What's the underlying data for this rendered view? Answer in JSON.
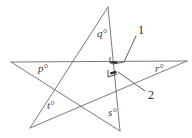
{
  "figure": {
    "kind": "geometry-star-polygon-diagram",
    "width": 192,
    "height": 138,
    "background_color": "#ffffff",
    "stroke_color": "#6b6b6b",
    "stroke_width": 0.9,
    "angle_labels": [
      {
        "id": "q",
        "text": "q°",
        "x": 97,
        "y": 28
      },
      {
        "id": "p",
        "text": "p°",
        "x": 38,
        "y": 63
      },
      {
        "id": "r",
        "text": "r°",
        "x": 155,
        "y": 63
      },
      {
        "id": "t",
        "text": "t°",
        "x": 47,
        "y": 100
      },
      {
        "id": "s",
        "text": "s°",
        "x": 108,
        "y": 107
      }
    ],
    "callouts": [
      {
        "id": "1",
        "text": "1",
        "x": 138,
        "y": 30
      },
      {
        "id": "2",
        "text": "2",
        "x": 148,
        "y": 95
      }
    ],
    "lines": [
      {
        "id": "horizontal-baseline",
        "x1": 11,
        "y1": 62,
        "x2": 187,
        "y2": 61
      },
      {
        "id": "left-apex-to-bottom-right",
        "x1": 11,
        "y1": 62,
        "x2": 120,
        "y2": 131
      },
      {
        "id": "top-apex-to-bottom-left",
        "x1": 108,
        "y1": 7,
        "x2": 30,
        "y2": 128
      },
      {
        "id": "top-apex-to-bottom-vertex",
        "x1": 108,
        "y1": 7,
        "x2": 120,
        "y2": 131
      },
      {
        "id": "bottom-left-to-right-apex",
        "x1": 30,
        "y1": 128,
        "x2": 187,
        "y2": 61
      }
    ],
    "leader_lines": [
      {
        "id": "leader-1",
        "x1": 136,
        "y1": 36,
        "x2": 124,
        "y2": 63
      },
      {
        "id": "leader-1-foot",
        "x1": 124,
        "y1": 63,
        "x2": 113,
        "y2": 64
      },
      {
        "id": "leader-2",
        "x1": 145,
        "y1": 91,
        "x2": 119,
        "y2": 72
      }
    ],
    "angle_markers": [
      {
        "id": "marker-1",
        "x": 113,
        "y": 63
      },
      {
        "id": "marker-2",
        "x": 113,
        "y": 74
      }
    ]
  }
}
